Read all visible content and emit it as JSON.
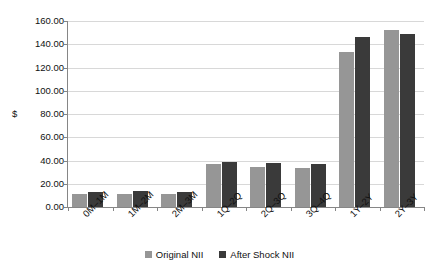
{
  "chart_data": {
    "type": "bar",
    "title": "",
    "subtitle": "",
    "xlabel": "",
    "ylabel": "$",
    "ylim": [
      0,
      160
    ],
    "ytick_step": 20,
    "ytick_labels": [
      "0.00",
      "20.00",
      "40.00",
      "60.00",
      "80.00",
      "100.00",
      "120.00",
      "140.00",
      "160.00"
    ],
    "grid": true,
    "legend_position": "bottom-center",
    "categories": [
      "0M–1M",
      "1M–2M",
      "2M–3M",
      "1Q–2Q",
      "2Q–3Q",
      "3Q–4Q",
      "1Y–2Y",
      "2Y–3Y"
    ],
    "series": [
      {
        "name": "Original NII",
        "color": "#969696",
        "values": [
          11.0,
          11.5,
          11.5,
          37.0,
          34.5,
          33.5,
          133.0,
          152.0
        ]
      },
      {
        "name": "After Shock NII",
        "color": "#3a3a3a",
        "values": [
          12.5,
          14.0,
          13.0,
          39.0,
          38.0,
          37.0,
          146.0,
          148.5
        ]
      }
    ]
  },
  "colors": {
    "background": "#ffffff",
    "gridline": "#d8d8d8",
    "axis": "#868686",
    "text": "#111111",
    "series_original": "#969696",
    "series_after_shock": "#3a3a3a"
  }
}
